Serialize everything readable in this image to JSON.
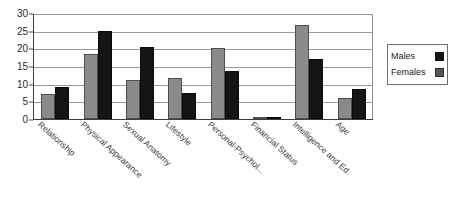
{
  "chart_data": {
    "type": "bar",
    "title": "",
    "xlabel": "",
    "ylabel": "",
    "ylim": [
      0,
      30
    ],
    "yticks": [
      0,
      5,
      10,
      15,
      20,
      25,
      30
    ],
    "grid": true,
    "legend_position": "right",
    "categories": [
      "Relationship",
      "Physical Appearance",
      "Sexual Anatomy",
      "Lifestyle",
      "Personal-Psychol...",
      "Financial Status",
      "Intelligence and Ed.",
      "Age"
    ],
    "series": [
      {
        "name": "Females",
        "color": "#8a8a8a",
        "values": [
          7,
          18.5,
          11,
          11.5,
          20,
          0.3,
          26.5,
          6
        ]
      },
      {
        "name": "Males",
        "color": "#151515",
        "values": [
          9,
          25,
          20.5,
          7.5,
          13.5,
          0.6,
          17,
          8.5
        ]
      }
    ]
  },
  "legend": {
    "entries": [
      {
        "label": "Males",
        "swatch": "black-square-swatch"
      },
      {
        "label": "Females",
        "swatch": "gray-square-swatch"
      }
    ]
  }
}
